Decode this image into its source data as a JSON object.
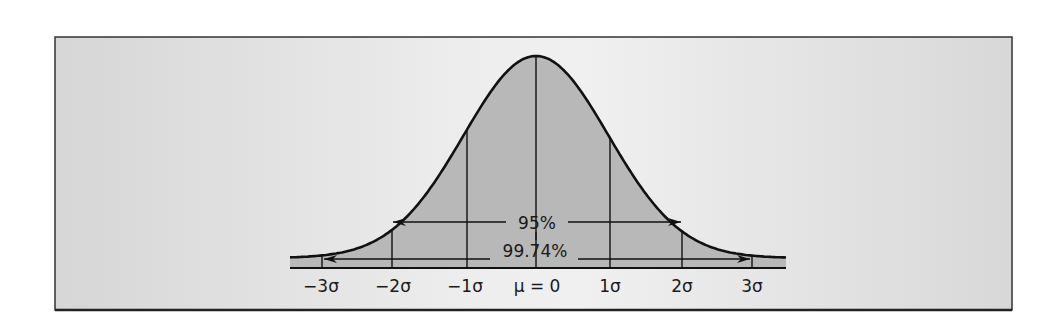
{
  "figure": {
    "frame": {
      "x": 55,
      "y": 37,
      "w": 957,
      "h": 273
    },
    "colors": {
      "page_bg": "#ffffff",
      "panel_bg": "#e3e3e3",
      "panel_bg_light": "#f2f2f2",
      "area_fill": "#b7b7b7",
      "line": "#111111",
      "frame_border": "#333333"
    },
    "curve": {
      "mean_x": 536,
      "sigma_px": 72.5,
      "peak_y": 56,
      "baseline_y": 268,
      "x_start": 290,
      "x_end": 786
    },
    "bands": {
      "baseline_bar_y": 258,
      "baseline_bar_h": 10
    }
  },
  "chart_data": {
    "type": "area",
    "title": "",
    "x": [
      -3,
      -2,
      -1,
      0,
      1,
      2,
      3
    ],
    "tick_labels": [
      "−3σ",
      "−2σ",
      "−1σ",
      "μ = 0",
      "1σ",
      "2σ",
      "3σ"
    ],
    "annotations": [
      {
        "label": "95%",
        "from": -2,
        "to": 2
      },
      {
        "label": "99.74%",
        "from": -3,
        "to": 3
      }
    ],
    "grid": false,
    "legend": null
  },
  "labels": {
    "ticks": [
      "−3σ",
      "−2σ",
      "−1σ",
      "μ = 0",
      "1σ",
      "2σ",
      "3σ"
    ],
    "band_95": "95%",
    "band_9974": "99.74%"
  }
}
